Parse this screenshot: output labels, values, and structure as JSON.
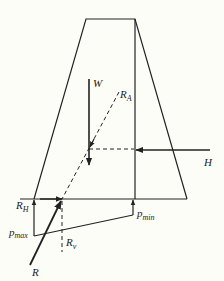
{
  "diagram": {
    "labels": {
      "W": "W",
      "R_A": "R",
      "R_A_sub": "A",
      "H": "H",
      "R_H": "R",
      "R_H_sub": "H",
      "p_max": "p",
      "p_max_sub": "max",
      "p_min": "p",
      "p_min_sub": "min",
      "R_v": "R",
      "R_v_sub": "v",
      "R": "R"
    },
    "colors": {
      "line": "#222222",
      "background": "#fdfdf8"
    }
  }
}
